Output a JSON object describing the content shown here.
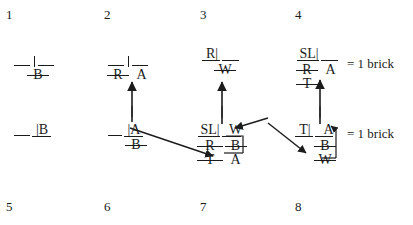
{
  "figure": {
    "ink_color": "#1b1b1b",
    "background": "#ffffff"
  },
  "panel_numbers": {
    "top_row": [
      "1",
      "2",
      "3",
      "4"
    ],
    "bottom_row": [
      "5",
      "6",
      "7",
      "8"
    ]
  },
  "legend": {
    "brick_label_top": "= 1 brick",
    "brick_label_bottom": "= 1 brick"
  },
  "panels": [
    {
      "id": "panel-1",
      "number": "1",
      "rows": [
        {
          "cells": [
            {
              "text": "",
              "struck": false
            },
            {
              "text": "",
              "struck": false
            }
          ]
        },
        {
          "cells": [
            {
              "text": "",
              "struck": false
            },
            {
              "text": "B",
              "struck": true
            }
          ]
        }
      ]
    },
    {
      "id": "panel-2",
      "number": "2",
      "rows": [
        {
          "cells": [
            {
              "text": "",
              "struck": false
            },
            {
              "text": "",
              "struck": false
            }
          ]
        },
        {
          "cells": [
            {
              "text": "R",
              "struck": true
            },
            {
              "text": "A",
              "struck": false
            }
          ]
        }
      ]
    },
    {
      "id": "panel-3",
      "number": "3",
      "rows": [
        {
          "cells": [
            {
              "text": "R|",
              "struck": false
            },
            {
              "text": "",
              "struck": false
            }
          ]
        },
        {
          "cells": [
            {
              "text": "",
              "struck": false
            },
            {
              "text": "W",
              "struck": true
            }
          ]
        }
      ]
    },
    {
      "id": "panel-4",
      "number": "4",
      "rows": [
        {
          "cells": [
            {
              "text": "SL|",
              "struck": false
            },
            {
              "text": "",
              "struck": false
            }
          ]
        },
        {
          "cells": [
            {
              "text": "R",
              "struck": true
            },
            {
              "text": "A",
              "struck": false
            }
          ]
        },
        {
          "cells": [
            {
              "text": "T",
              "struck": true
            },
            {
              "text": "",
              "struck": false
            }
          ]
        }
      ]
    },
    {
      "id": "panel-5",
      "number": "5",
      "rows": [
        {
          "cells": [
            {
              "text": "|B",
              "struck": false
            }
          ]
        }
      ]
    },
    {
      "id": "panel-6",
      "number": "6",
      "rows": [
        {
          "cells": [
            {
              "text": "|A",
              "struck": false
            }
          ]
        },
        {
          "cells": [
            {
              "text": "B",
              "struck": true
            }
          ]
        }
      ]
    },
    {
      "id": "panel-7",
      "number": "7",
      "rows": [
        {
          "cells": [
            {
              "text": "SL|",
              "struck": false
            },
            {
              "text": "W",
              "struck": false
            }
          ]
        },
        {
          "cells": [
            {
              "text": "R",
              "struck": true
            },
            {
              "text": "B",
              "struck": true
            }
          ]
        },
        {
          "cells": [
            {
              "text": "T",
              "struck": true
            },
            {
              "text": "A",
              "struck": false
            }
          ]
        }
      ]
    },
    {
      "id": "panel-8",
      "number": "8",
      "rows": [
        {
          "cells": [
            {
              "text": "T|",
              "struck": false
            },
            {
              "text": "A",
              "struck": false
            }
          ]
        },
        {
          "cells": [
            {
              "text": "",
              "struck": false
            },
            {
              "text": "B",
              "struck": true
            }
          ]
        },
        {
          "cells": [
            {
              "text": "",
              "struck": false
            },
            {
              "text": "W",
              "struck": true
            }
          ]
        }
      ]
    }
  ],
  "symbols": {
    "p1_b": "B",
    "p2_r": "R",
    "p2_a": "A",
    "p3_r": "R|",
    "p3_w": "W",
    "p4_sl": "SL|",
    "p4_r": "R",
    "p4_a": "A",
    "p4_t": "T",
    "p5_b": "|B",
    "p6_a": "|A",
    "p6_b": "B",
    "p7_sl": "SL|",
    "p7_w": "W",
    "p7_r": "R",
    "p7_b": "B",
    "p7_t": "T",
    "p7_a": "A",
    "p8_t": "T|",
    "p8_a": "A",
    "p8_b": "B",
    "p8_w": "W"
  },
  "arrows": [
    {
      "name": "arrow-up-panel6-to-panel2",
      "kind": "vertical-up"
    },
    {
      "name": "arrow-up-panel7-to-panel3",
      "kind": "vertical-up"
    },
    {
      "name": "arrow-up-panel8-to-panel4",
      "kind": "vertical-up"
    },
    {
      "name": "arrow-diagonal-panel6-to-panel7",
      "kind": "diagonal-down-right"
    },
    {
      "name": "arrow-diagonal-panel7-to-panel8",
      "kind": "diagonal-down-right"
    },
    {
      "name": "arrow-elbow-panel7-internal",
      "kind": "elbow-left"
    },
    {
      "name": "arrow-elbow-panel8-internal",
      "kind": "elbow-up"
    }
  ]
}
